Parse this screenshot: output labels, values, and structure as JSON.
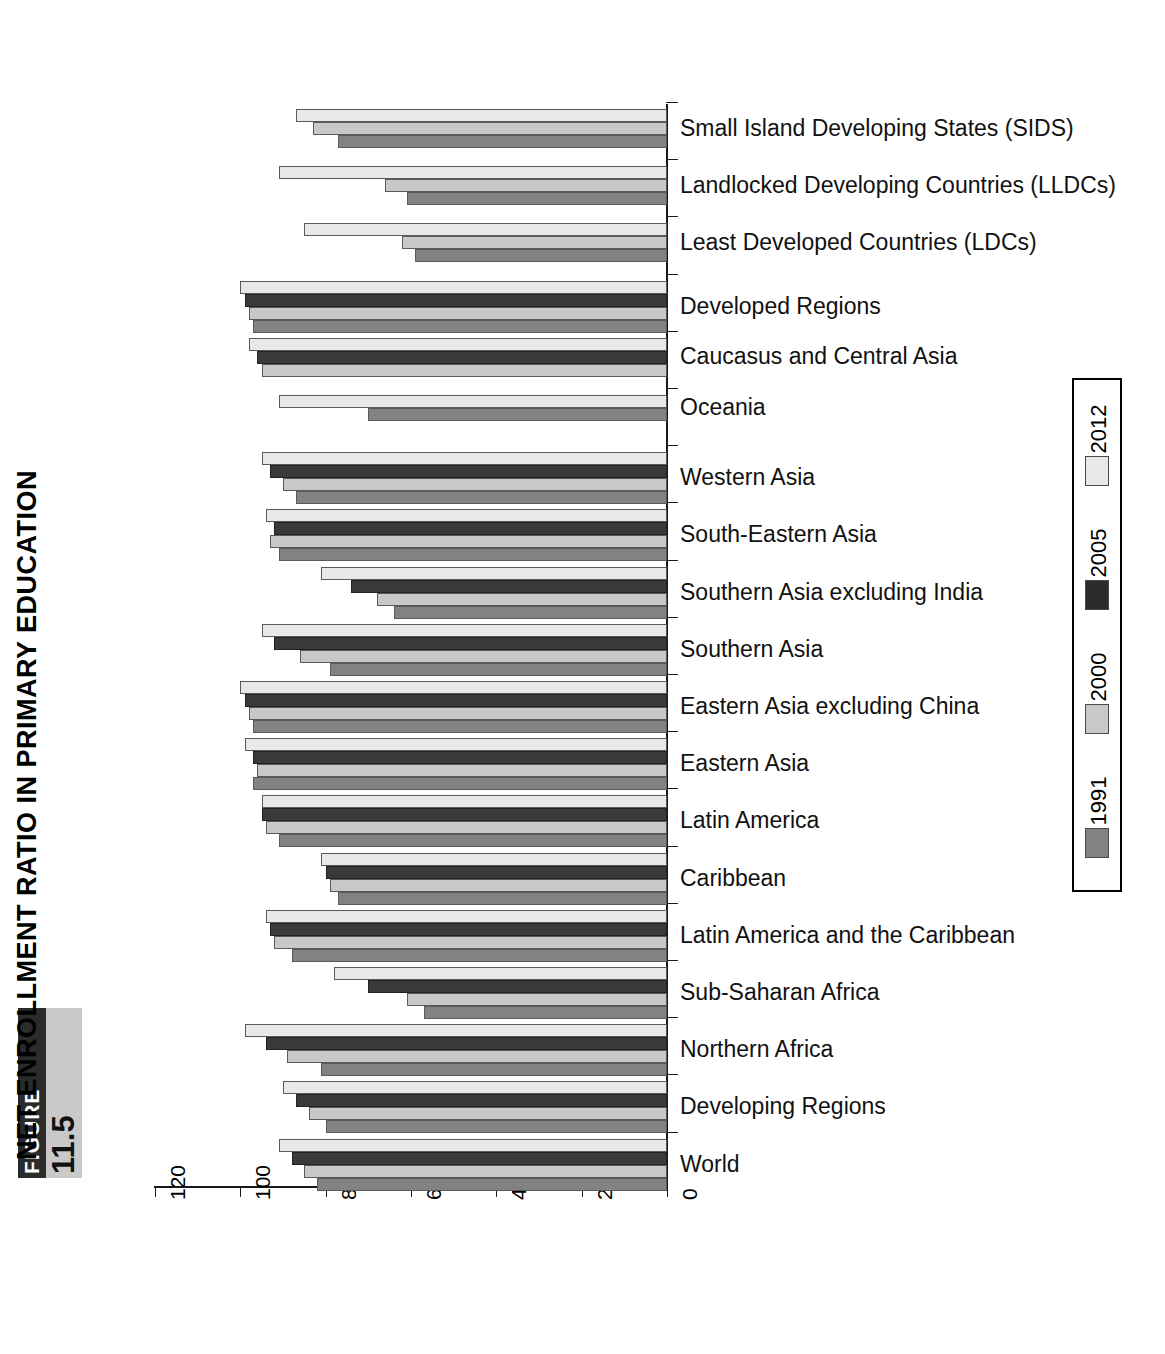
{
  "figure": {
    "badge_label": "FIGURE",
    "badge_number": "11.5",
    "title": "NET ENROLLMENT RATIO IN PRIMARY EDUCATION"
  },
  "chart_data": {
    "type": "bar",
    "orientation": "horizontal",
    "title": "NET ENROLLMENT RATIO IN PRIMARY EDUCATION",
    "xlabel": "",
    "ylabel": "",
    "xlim": [
      0,
      120
    ],
    "x_axis_reversed": true,
    "grid": false,
    "legend_position": "right",
    "xticks": [
      120,
      100,
      80,
      60,
      40,
      20,
      0
    ],
    "tick_labels": [
      "120",
      "100",
      "80",
      "60",
      "40",
      "20",
      "0"
    ],
    "categories": [
      "Small Island Developing States (SIDS)",
      "Landlocked Developing Countries (LLDCs)",
      "Least Developed Countries (LDCs)",
      "Developed Regions",
      "Caucasus and Central Asia",
      "Oceania",
      "Western Asia",
      "South-Eastern Asia",
      "Southern Asia excluding India",
      "Southern Asia",
      "Eastern Asia excluding China",
      "Eastern Asia",
      "Latin America",
      "Caribbean",
      "Latin America and the Caribbean",
      "Sub-Saharan Africa",
      "Northern Africa",
      "Developing Regions",
      "World"
    ],
    "series": [
      {
        "name": "2012",
        "color": "#e8e8e8",
        "values": [
          87,
          91,
          85,
          100,
          98,
          91,
          95,
          94,
          81,
          95,
          100,
          99,
          95,
          81,
          94,
          78,
          99,
          90,
          91
        ]
      },
      {
        "name": "2005",
        "color": "#2b2b2b",
        "values": [
          null,
          null,
          null,
          99,
          96,
          null,
          93,
          92,
          74,
          92,
          99,
          97,
          95,
          80,
          93,
          70,
          94,
          87,
          88
        ]
      },
      {
        "name": "2000",
        "color": "#c8c8c8",
        "values": [
          83,
          66,
          62,
          98,
          95,
          null,
          90,
          93,
          68,
          86,
          98,
          96,
          94,
          79,
          92,
          61,
          89,
          84,
          85
        ]
      },
      {
        "name": "1991",
        "color": "#828282",
        "values": [
          77,
          61,
          59,
          97,
          null,
          70,
          87,
          91,
          64,
          79,
          97,
          97,
          91,
          77,
          88,
          57,
          81,
          80,
          82
        ]
      }
    ]
  },
  "legend": {
    "entries": [
      {
        "label": "2012",
        "swatch": "y2012"
      },
      {
        "label": "2005",
        "swatch": "y2005"
      },
      {
        "label": "2000",
        "swatch": "y2000"
      },
      {
        "label": "1991",
        "swatch": "y1991"
      }
    ]
  }
}
